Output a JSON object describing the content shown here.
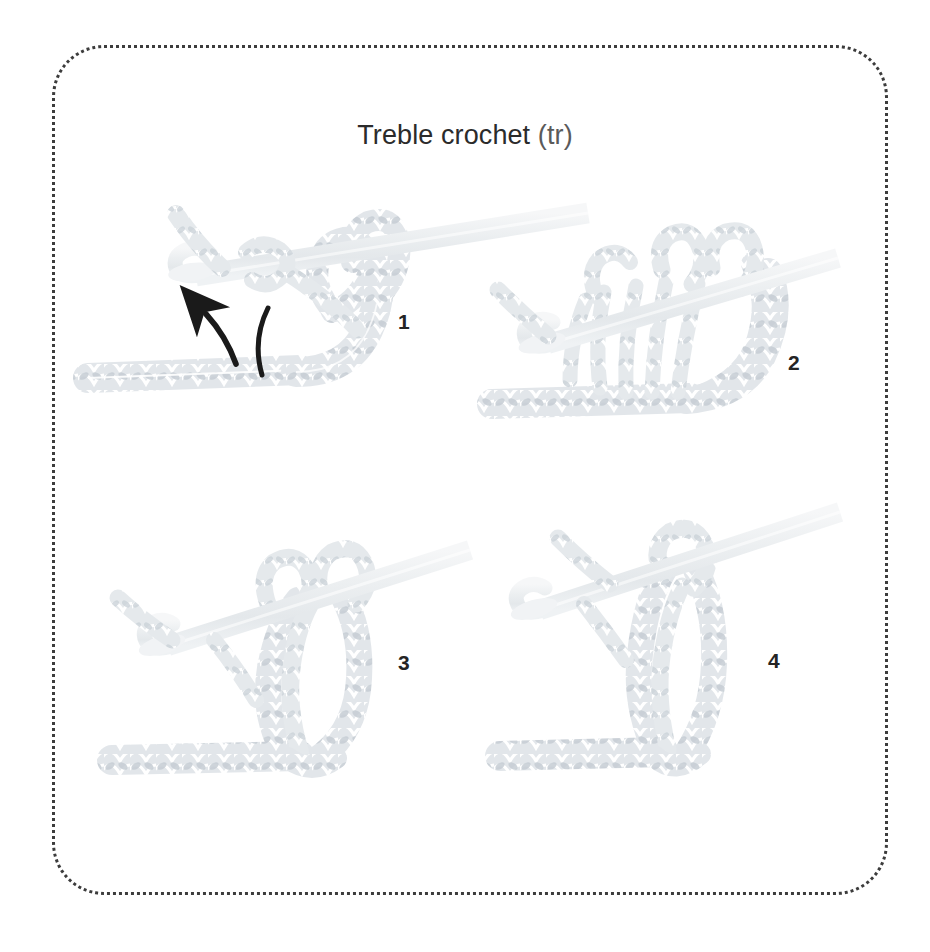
{
  "page": {
    "width": 930,
    "height": 952,
    "background": "#ffffff",
    "frame": {
      "style": "dotted-rounded-rectangle",
      "color": "#3c3c3c"
    }
  },
  "title": {
    "full": "Treble crochet (tr)",
    "main": "Treble crochet",
    "abbreviation": "(tr)",
    "color": "#2b2b2b",
    "abbr_color": "#5a5a5a"
  },
  "steps": [
    {
      "number": "1",
      "caption": "Yarn over hook twice, insert hook into stitch, yarn over and draw loop through",
      "has_arrow": true,
      "has_yarn_guide_line": true
    },
    {
      "number": "2",
      "caption": "Yarn over and draw through two loops",
      "has_arrow": false,
      "has_yarn_guide_line": false
    },
    {
      "number": "3",
      "caption": "Yarn over and draw through two loops again",
      "has_arrow": false,
      "has_yarn_guide_line": false
    },
    {
      "number": "4",
      "caption": "Yarn over and draw through last two loops to complete treble crochet",
      "has_arrow": false,
      "has_yarn_guide_line": false
    }
  ],
  "colors": {
    "yarn_light": "#e8ebee",
    "yarn_mid": "#d4d9de",
    "yarn_dark": "#c2c8cf",
    "hook": "#eef0f2",
    "hook_edge": "#e2e6e9",
    "arrow": "#1a1a1a",
    "text": "#242424",
    "border": "#3c3c3c",
    "background": "#ffffff"
  },
  "icons": {
    "arrow": "arrow-up-left-icon",
    "guide": "yarn-guide-curve-icon"
  }
}
